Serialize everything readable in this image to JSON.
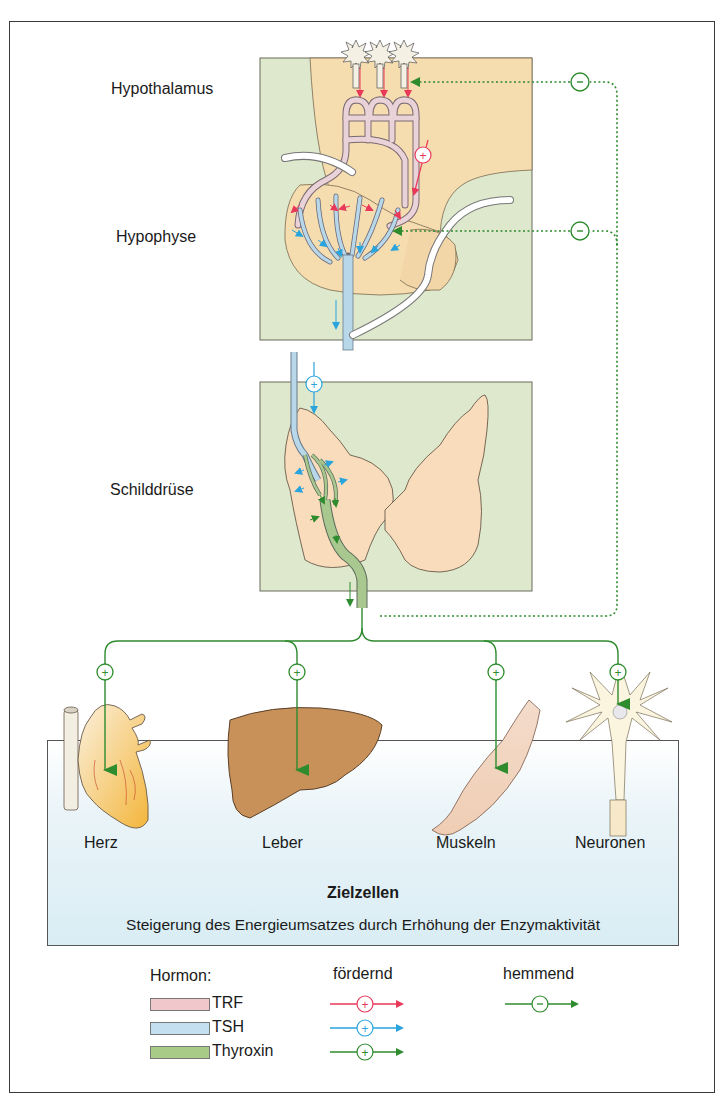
{
  "regions": {
    "hypothalamus": "Hypothalamus",
    "hypophyse": "Hypophyse",
    "schilddruese": "Schilddrüse"
  },
  "target_cells": {
    "title": "Zielzellen",
    "description": "Steigerung des Energieumsatzes durch Erhöhung der Enzymaktivität",
    "organs": [
      {
        "label": "Herz"
      },
      {
        "label": "Leber"
      },
      {
        "label": "Muskeln"
      },
      {
        "label": "Neuronen"
      }
    ]
  },
  "legend": {
    "hormone_heading": "Hormon:",
    "promoting_heading": "fördernd",
    "inhibiting_heading": "hemmend",
    "hormones": [
      {
        "name": "TRF",
        "color": "#f0c8cc",
        "arrow_color": "#e8395a"
      },
      {
        "name": "TSH",
        "color": "#c4e0f0",
        "arrow_color": "#2aa4dc"
      },
      {
        "name": "Thyroxin",
        "color": "#a8cc88",
        "arrow_color": "#2e8b2e"
      }
    ],
    "promote_symbol": "+",
    "inhibit_symbol": "−"
  },
  "colors": {
    "panel_bg": "#dde8cc",
    "tissue": "#f6ddb0",
    "trf": "#e8395a",
    "tsh": "#2aa4dc",
    "thyroxin": "#2e8b2e",
    "vessel_trf": "#e9d2d8",
    "vessel_tsh": "#b8d8ea",
    "vessel_thyroxin": "#a8c890"
  },
  "feedback": {
    "symbol": "−"
  }
}
